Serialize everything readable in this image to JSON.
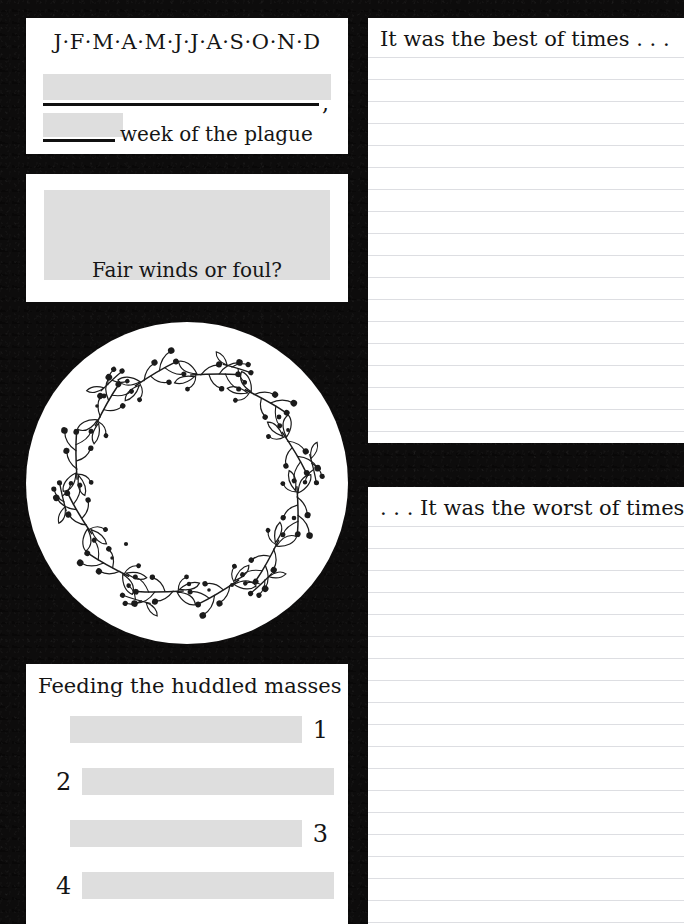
{
  "page": {
    "background_color": "#0d0c0c",
    "card_color": "#ffffff",
    "fill_color": "#dedede",
    "rule_color": "#dddee2",
    "ink_color": "#141414",
    "width": 684,
    "height": 924
  },
  "months_card": {
    "months_strip": "J·F·M·A·M·J·J·A·S·O·N·D",
    "months": [
      "J",
      "F",
      "M",
      "A",
      "M",
      "J",
      "J",
      "A",
      "S",
      "O",
      "N",
      "D"
    ],
    "blank_line_1_value": "",
    "comma": ",",
    "blank_line_2_value": "",
    "caption": "week of the plague"
  },
  "weather_card": {
    "sketch_value": "",
    "caption": "Fair winds or foul?"
  },
  "wreath": {
    "label": "floral-wreath-illustration",
    "inner_value": ""
  },
  "feeding_card": {
    "title": "Feeding the huddled masses",
    "rows": [
      {
        "number": "1",
        "value": "",
        "number_side": "right"
      },
      {
        "number": "2",
        "value": "",
        "number_side": "left"
      },
      {
        "number": "3",
        "value": "",
        "number_side": "right"
      },
      {
        "number": "4",
        "value": "",
        "number_side": "left"
      }
    ]
  },
  "notes": {
    "best": {
      "heading": "It was the best of times . . .",
      "body": "",
      "rule_count": 18
    },
    "worst": {
      "heading": ". . . It was the worst of times",
      "body": "",
      "rule_count": 19
    }
  }
}
